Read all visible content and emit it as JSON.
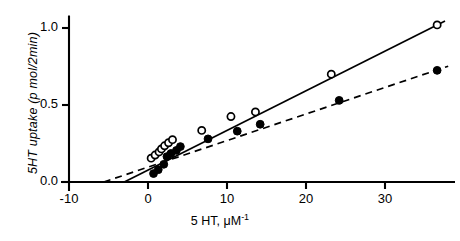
{
  "chart_data": {
    "type": "scatter",
    "title": "",
    "subtitle": "",
    "xlabel": "5 HT, μM⁻¹",
    "ylabel": "5HT uptake (p mol/2min)",
    "xlim": [
      -12,
      40
    ],
    "ylim": [
      -0.07,
      1.12
    ],
    "xticks": [
      -10,
      0,
      10,
      20,
      30
    ],
    "xtick_labels": [
      "-10",
      "0",
      "10",
      "20",
      "30"
    ],
    "yticks": [
      0.0,
      0.5,
      1.0
    ],
    "ytick_labels": [
      "0.0",
      "0.5",
      "1.0"
    ],
    "grid": false,
    "legend": "none",
    "annotations": [],
    "series": [
      {
        "name": "control",
        "marker": "open-circle",
        "line_style": "solid",
        "points": [
          {
            "x": 0.4,
            "y": 0.155
          },
          {
            "x": 0.9,
            "y": 0.175
          },
          {
            "x": 1.4,
            "y": 0.195
          },
          {
            "x": 1.7,
            "y": 0.215
          },
          {
            "x": 2.1,
            "y": 0.235
          },
          {
            "x": 2.6,
            "y": 0.255
          },
          {
            "x": 3.1,
            "y": 0.275
          },
          {
            "x": 6.8,
            "y": 0.335
          },
          {
            "x": 10.5,
            "y": 0.425
          },
          {
            "x": 13.6,
            "y": 0.455
          },
          {
            "x": 23.2,
            "y": 0.7
          },
          {
            "x": 36.6,
            "y": 1.02
          }
        ],
        "fit_line": {
          "x1": -3.0,
          "y1": 0.0,
          "x2": 37.6,
          "y2": 1.045
        }
      },
      {
        "name": "treated",
        "marker": "filled-circle",
        "line_style": "dashed",
        "points": [
          {
            "x": 0.7,
            "y": 0.055
          },
          {
            "x": 1.3,
            "y": 0.08
          },
          {
            "x": 2.0,
            "y": 0.115
          },
          {
            "x": 2.4,
            "y": 0.165
          },
          {
            "x": 2.9,
            "y": 0.185
          },
          {
            "x": 3.6,
            "y": 0.205
          },
          {
            "x": 4.1,
            "y": 0.23
          },
          {
            "x": 7.6,
            "y": 0.28
          },
          {
            "x": 11.3,
            "y": 0.33
          },
          {
            "x": 14.2,
            "y": 0.375
          },
          {
            "x": 24.2,
            "y": 0.53
          },
          {
            "x": 36.6,
            "y": 0.725
          }
        ],
        "fit_line": {
          "x1": -5.6,
          "y1": 0.0,
          "x2": 38.0,
          "y2": 0.752
        }
      }
    ]
  },
  "axes": {
    "y_label": "5HT uptake (p mol/2min)",
    "x_label_main": "5 HT, μM",
    "x_label_sup": "-1"
  },
  "colors": {
    "axis": "#000000",
    "series_control": "#000000",
    "series_treated": "#000000",
    "background": "#ffffff"
  }
}
